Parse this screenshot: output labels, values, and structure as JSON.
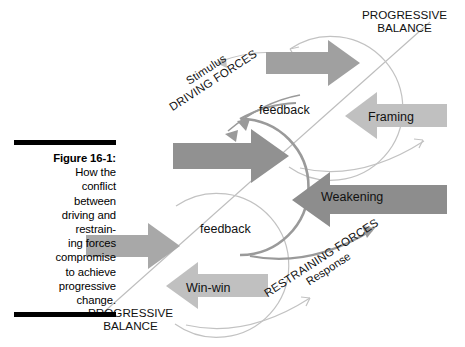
{
  "figure": {
    "label": "Figure 16-1:",
    "caption_lines": [
      "How the",
      "conflict",
      "between",
      "driving and",
      "restrain-",
      "ing forces",
      "compromise",
      "to achieve",
      "progressive",
      "change."
    ]
  },
  "diagram": {
    "axes": [
      {
        "name": "driving-forces-axis",
        "line1": "Stimulus",
        "line2": "DRIVING FORCES"
      },
      {
        "name": "restraining-forces-axis",
        "line1": "RESTRAINING FORCES",
        "line2": "Response"
      }
    ],
    "corner_labels": [
      {
        "name": "progressive-balance-top",
        "line1": "PROGRESSIVE",
        "line2": "BALANCE"
      },
      {
        "name": "progressive-balance-bottom",
        "line1": "PROGRESSIVE",
        "line2": "BALANCE"
      }
    ],
    "feedback_labels": [
      {
        "name": "feedback-top",
        "text": "feedback"
      },
      {
        "name": "feedback-bottom",
        "text": "feedback"
      }
    ],
    "arrows": [
      {
        "name": "arrow-top-right-driving",
        "label": "",
        "direction": "right",
        "fill": "#a0a0a0"
      },
      {
        "name": "arrow-framing",
        "label": "Framing",
        "direction": "left",
        "fill": "#c0c0c0"
      },
      {
        "name": "arrow-center-driving",
        "label": "",
        "direction": "right",
        "fill": "#919191"
      },
      {
        "name": "arrow-weakening",
        "label": "Weakening",
        "direction": "left",
        "fill": "#8d8d8d"
      },
      {
        "name": "arrow-bottom-left-driving",
        "label": "",
        "direction": "right",
        "fill": "#a8a8a8"
      },
      {
        "name": "arrow-winwin",
        "label": "Win-win",
        "direction": "left",
        "fill": "#c0c0c0"
      }
    ],
    "colors": {
      "arrow_dark": "#8d8d8d",
      "arrow_mid": "#a0a0a0",
      "arrow_light": "#c0c0c0",
      "loop_stroke": "#9a9a9a",
      "loop_stroke_light": "#c2c2c2",
      "diagonal_line": "#bbbbbb",
      "text": "#111111",
      "rule": "#000000",
      "background": "#ffffff"
    }
  }
}
